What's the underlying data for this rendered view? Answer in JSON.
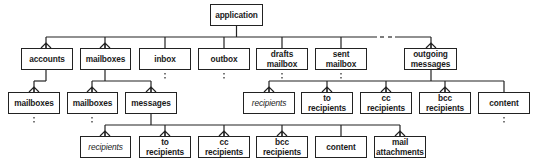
{
  "diagram": {
    "type": "hierarchy",
    "colors": {
      "line": "#222222",
      "box_fill": "#ffffff",
      "text": "#1a1a1a"
    },
    "root": {
      "id": "application",
      "label": "application"
    },
    "level1": [
      {
        "id": "accounts",
        "label": "accounts",
        "connector": "crows-foot",
        "has_children": true
      },
      {
        "id": "mailboxes",
        "label": "mailboxes",
        "connector": "crows-foot",
        "has_children": true
      },
      {
        "id": "inbox",
        "label": "inbox",
        "connector": "single",
        "continuation": "dotted"
      },
      {
        "id": "outbox",
        "label": "outbox",
        "connector": "single",
        "continuation": "dotted"
      },
      {
        "id": "drafts-mailbox",
        "label": "drafts\nmailbox",
        "connector": "single",
        "continuation": "dotted"
      },
      {
        "id": "sent-mailbox",
        "label": "sent\nmailbox",
        "connector": "single",
        "continuation": "dotted"
      },
      {
        "id": "ellipsis",
        "label": "- -",
        "note": "dashed gap in bus line"
      },
      {
        "id": "outgoing-messages",
        "label": "outgoing\nmessages",
        "connector": "crows-foot",
        "has_children": true
      }
    ],
    "accounts_children": [
      {
        "id": "accounts-mailboxes",
        "label": "mailboxes",
        "connector": "crows-foot",
        "continuation": "dotted"
      }
    ],
    "mailboxes_children": [
      {
        "id": "mailboxes-mailboxes",
        "label": "mailboxes",
        "connector": "crows-foot",
        "continuation": "dotted"
      },
      {
        "id": "messages",
        "label": "messages",
        "connector": "crows-foot",
        "has_children": true
      }
    ],
    "outgoing_children": [
      {
        "id": "out-recipients",
        "label": "recipients",
        "italic": true,
        "connector": "crows-foot"
      },
      {
        "id": "out-to-recipients",
        "label": "to\nrecipients",
        "connector": "crows-foot"
      },
      {
        "id": "out-cc-recipients",
        "label": "cc\nrecipients",
        "connector": "crows-foot"
      },
      {
        "id": "out-bcc-recipients",
        "label": "bcc\nrecipients",
        "connector": "crows-foot"
      },
      {
        "id": "out-content",
        "label": "content",
        "connector": "single",
        "continuation": "dotted"
      }
    ],
    "messages_children": [
      {
        "id": "msg-recipients",
        "label": "recipients",
        "italic": true,
        "connector": "crows-foot"
      },
      {
        "id": "msg-to-recipients",
        "label": "to\nrecipients",
        "connector": "crows-foot"
      },
      {
        "id": "msg-cc-recipients",
        "label": "cc\nrecipients",
        "connector": "crows-foot"
      },
      {
        "id": "msg-bcc-recipients",
        "label": "bcc\nrecipients",
        "connector": "crows-foot"
      },
      {
        "id": "msg-content",
        "label": "content",
        "connector": "single"
      },
      {
        "id": "msg-mail-attachments",
        "label": "mail\nattachments",
        "connector": "crows-foot"
      }
    ]
  }
}
